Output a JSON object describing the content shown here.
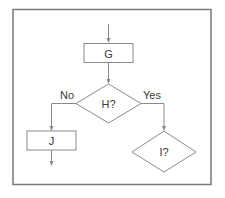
{
  "diagram": {
    "type": "flowchart",
    "colors": {
      "frame": "#7a7a7a",
      "line": "#8a8a8a",
      "text": "#3a3a3a",
      "background": "#ffffff"
    },
    "nodes": [
      {
        "id": "G",
        "shape": "rectangle",
        "label": "G"
      },
      {
        "id": "H",
        "shape": "diamond",
        "label": "H?"
      },
      {
        "id": "J",
        "shape": "rectangle",
        "label": "J"
      },
      {
        "id": "I",
        "shape": "diamond",
        "label": "I?"
      }
    ],
    "edges": [
      {
        "from": "start",
        "to": "G",
        "label": ""
      },
      {
        "from": "G",
        "to": "H",
        "label": ""
      },
      {
        "from": "H",
        "to": "J",
        "label": "No"
      },
      {
        "from": "H",
        "to": "I",
        "label": "Yes"
      },
      {
        "from": "J",
        "to": "end",
        "label": ""
      }
    ],
    "branch_labels": {
      "no": "No",
      "yes": "Yes"
    }
  }
}
